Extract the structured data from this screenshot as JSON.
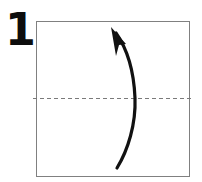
{
  "diagram": {
    "kind": "origami-instruction-step",
    "step_number": "1",
    "canvas": {
      "width": 202,
      "height": 182,
      "background": "#ffffff"
    },
    "paper": {
      "shape": "square",
      "x": 36,
      "y": 21,
      "width": 153,
      "height": 155,
      "stroke": "#808080",
      "stroke_width": 1,
      "fill": "#ffffff"
    },
    "fold_line": {
      "label": "horizontal-center-crease",
      "style": "dashed",
      "orientation": "horizontal",
      "y": 98,
      "x_start": 33,
      "x_end": 192,
      "stroke": "#7a7a7a",
      "stroke_width": 1,
      "dash_pattern": "4 3"
    },
    "arrow": {
      "label": "valley-fold-arrow",
      "direction": "bottom-to-top-curved",
      "stroke": "#111111",
      "path": "M117,168 C128,150 136,124 135,98 C134,74 128,50 116,33",
      "head": {
        "tip_x": 111,
        "tip_y": 27,
        "points": "111,27 126,44 119,45 116,56"
      }
    }
  }
}
